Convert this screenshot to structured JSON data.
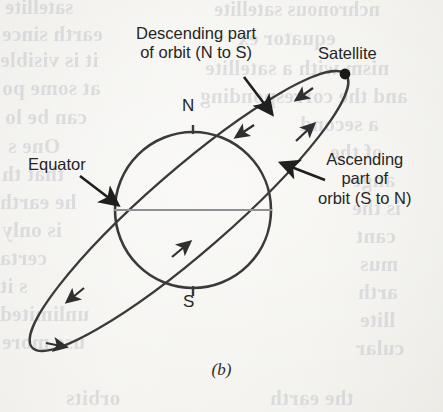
{
  "figure": {
    "caption": "(b)",
    "labels": {
      "descending": "Descending part\nof orbit (N to S)",
      "satellite": "Satellite",
      "ascending": "Ascending\npart of\norbit (S to N)",
      "equator": "Equator",
      "north_pole": "N",
      "south_pole": "S"
    },
    "colors": {
      "ink": "#2f2f2f",
      "equator_line": "#8f9092",
      "paper": "#f3f2ee",
      "ghost_text": "#b9bcc4"
    }
  },
  "chart_data": {
    "type": "diagram",
    "elements": [
      {
        "name": "earth",
        "shape": "circle",
        "cx": 193,
        "cy": 210,
        "r": 78
      },
      {
        "name": "equator",
        "shape": "line",
        "x1": 115,
        "y1": 210,
        "x2": 271,
        "y2": 210
      },
      {
        "name": "orbit",
        "shape": "ellipse",
        "cx": 189,
        "cy": 211,
        "rx": 208,
        "ry": 41,
        "rotation_deg": -41
      },
      {
        "name": "satellite",
        "shape": "point",
        "x": 345,
        "y": 74
      },
      {
        "name": "north-pole-tick",
        "shape": "tick",
        "x": 193,
        "y1": 126,
        "y2": 134
      },
      {
        "name": "south-pole-tick",
        "shape": "tick",
        "x": 193,
        "y1": 286,
        "y2": 294
      }
    ],
    "annotations": [
      {
        "text": "Descending part of orbit (N to S)",
        "arrow_from": [
          243,
          78
        ],
        "arrow_to": [
          272,
          113
        ]
      },
      {
        "text": "Satellite",
        "points_to": [
          345,
          74
        ]
      },
      {
        "text": "Ascending part of orbit (S to N)",
        "arrow_from": [
          322,
          178
        ],
        "arrow_to": [
          282,
          163
        ]
      },
      {
        "text": "Equator",
        "arrow_from": [
          82,
          178
        ],
        "arrow_to": [
          119,
          206
        ]
      }
    ],
    "orbit_direction_markers": [
      {
        "name": "descending-arrow-upper",
        "at": [
          300,
          97
        ],
        "heading": "down-left"
      },
      {
        "name": "descending-arrow-mid",
        "at": [
          239,
          134
        ],
        "heading": "down-left"
      },
      {
        "name": "descending-arrow-lower-left",
        "at": [
          70,
          298
        ],
        "heading": "down-left"
      },
      {
        "name": "ascending-arrow-loop",
        "at": [
          62,
          342
        ],
        "heading": "right"
      },
      {
        "name": "ascending-arrow-core",
        "at": [
          187,
          245
        ],
        "heading": "up-right"
      },
      {
        "name": "ascending-arrow-upper",
        "at": [
          311,
          126
        ],
        "heading": "up-right"
      }
    ],
    "xlabel": "",
    "ylabel": "",
    "grid": false,
    "legend": null
  },
  "ghost_text": {
    "lines": [
      {
        "text": "satellite",
        "x": 5,
        "y": -4,
        "size": 20
      },
      {
        "text": "earth since",
        "x": 2,
        "y": 22,
        "size": 21
      },
      {
        "text": "it is visible",
        "x": 0,
        "y": 48,
        "size": 21
      },
      {
        "text": "at some po",
        "x": 2,
        "y": 76,
        "size": 21
      },
      {
        "text": "can be lo",
        "x": 5,
        "y": 105,
        "size": 21
      },
      {
        "text": "One s",
        "x": 8,
        "y": 134,
        "size": 21
      },
      {
        "text": "that th",
        "x": 2,
        "y": 162,
        "size": 21
      },
      {
        "text": "he earth",
        "x": 0,
        "y": 190,
        "size": 21
      },
      {
        "text": "is only",
        "x": 2,
        "y": 218,
        "size": 21
      },
      {
        "text": "certa",
        "x": 0,
        "y": 246,
        "size": 21
      },
      {
        "text": "s it",
        "x": 0,
        "y": 274,
        "size": 21
      },
      {
        "text": "unlimited",
        "x": 0,
        "y": 302,
        "size": 21
      },
      {
        "text": "use more",
        "x": 2,
        "y": 330,
        "size": 21
      },
      {
        "text": "nchronous satellite",
        "x": 214,
        "y": -2,
        "size": 20
      },
      {
        "text": "equator ex",
        "x": 238,
        "y": 26,
        "size": 21
      },
      {
        "text": "nism with a satellite",
        "x": 205,
        "y": 56,
        "size": 21
      },
      {
        "text": "and the corresponding",
        "x": 200,
        "y": 84,
        "size": 21
      },
      {
        "text": "a second",
        "x": 300,
        "y": 112,
        "size": 21
      },
      {
        "text": "of the",
        "x": 330,
        "y": 140,
        "size": 21
      },
      {
        "text": "ange",
        "x": 352,
        "y": 168,
        "size": 21
      },
      {
        "text": "is the",
        "x": 352,
        "y": 196,
        "size": 21
      },
      {
        "text": "cant",
        "x": 356,
        "y": 224,
        "size": 21
      },
      {
        "text": "mus",
        "x": 360,
        "y": 252,
        "size": 21
      },
      {
        "text": "arth",
        "x": 358,
        "y": 280,
        "size": 21
      },
      {
        "text": "llite",
        "x": 360,
        "y": 308,
        "size": 21
      },
      {
        "text": "cular",
        "x": 356,
        "y": 336,
        "size": 21
      },
      {
        "text": "orbits",
        "x": 66,
        "y": 386,
        "size": 21
      },
      {
        "text": "the earth",
        "x": 270,
        "y": 386,
        "size": 21
      }
    ]
  }
}
